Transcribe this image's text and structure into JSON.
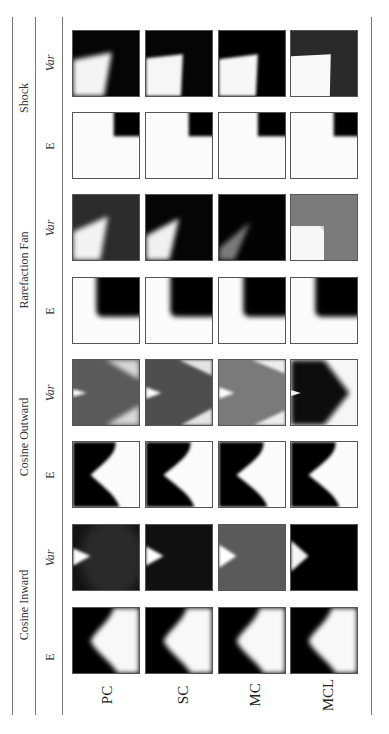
{
  "figure": {
    "orientation": "rotated-90-ccw",
    "groups": [
      {
        "label": "Shock",
        "sub": [
          "Var",
          "E"
        ]
      },
      {
        "label": "Rarefaction Fan",
        "sub": [
          "Var",
          "E"
        ]
      },
      {
        "label": "Cosine Outward",
        "sub": [
          "Var",
          "E"
        ]
      },
      {
        "label": "Cosine Inward",
        "sub": [
          "Var",
          "E"
        ]
      }
    ],
    "methods": [
      "PC",
      "SC",
      "MC",
      "MCL"
    ],
    "tiles": {
      "shock_var": [
        "dark field, bright wedge lower-left (blurred)",
        "dark field, bright wedge lower-left",
        "dark field, bright wedge lower-left (sharp)",
        "dark gray field, bright square lower-left"
      ],
      "shock_e": [
        "white field, black square upper-right",
        "white field, black square upper-right",
        "white field, black square upper-right",
        "white field, black square upper-right"
      ],
      "rarefaction_var": [
        "gray field, bright fan lower-left",
        "black field, bright fan lower-left",
        "black field, faint fan lower-left",
        "gray field, white square lower-left"
      ],
      "rarefaction_e": [
        "white L, black rounded square upper-right",
        "white L, black rounded square upper-right",
        "white L, black rounded square upper-right",
        "white L, black rounded square upper-right"
      ],
      "cosine_outward_var": [
        "gray field, bright tip left, bright corners right",
        "gray field, bright tip left, bright corners right",
        "light gray field, bright tip left",
        "black chevron, white right side"
      ],
      "cosine_outward_e": [
        "black left, white chevron right",
        "black left, white chevron right",
        "black left, white chevron right",
        "black left, white chevron right"
      ],
      "cosine_inward_var": [
        "dark field, white tip left",
        "dark field, white tip left",
        "gray field, white tip left",
        "black field, white tip left"
      ],
      "cosine_inward_e": [
        "black left, blurred white chevron",
        "black left, blurred white chevron",
        "black left, blurred white chevron",
        "black left, blurred white chevron"
      ]
    }
  }
}
